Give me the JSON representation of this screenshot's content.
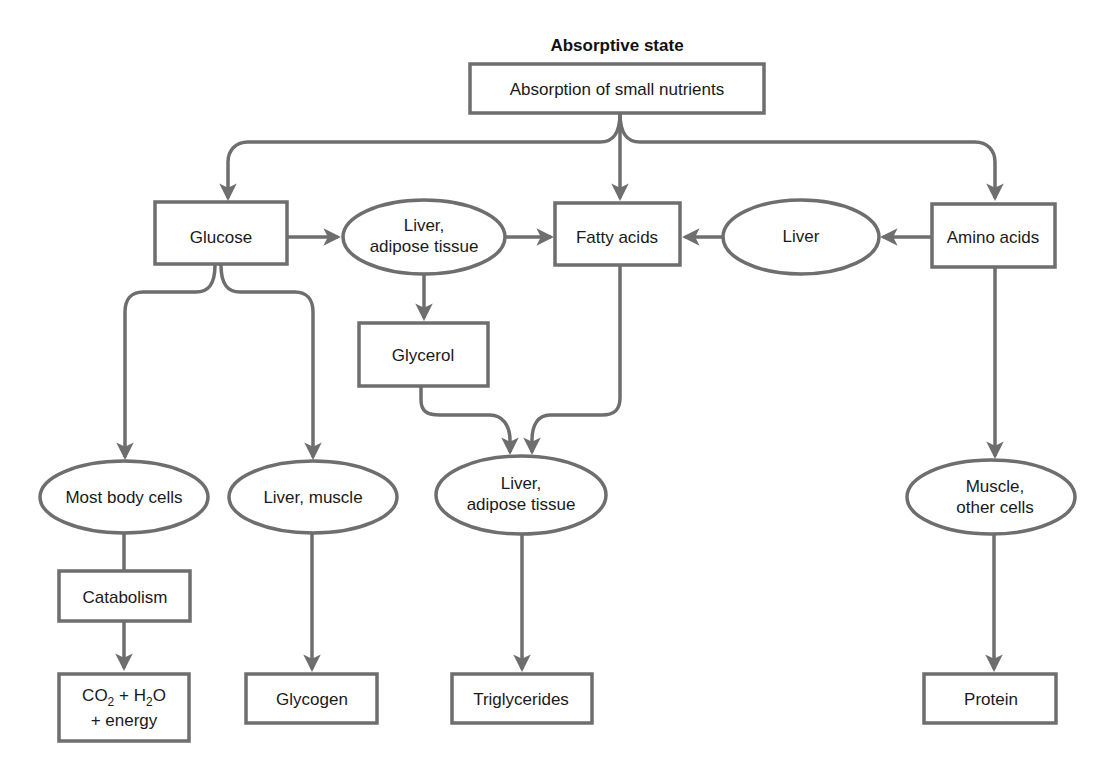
{
  "title": "Absorptive state",
  "colors": {
    "stroke": "#6e6e6e",
    "text": "#1a1a1a",
    "background": "#ffffff"
  },
  "nodes": {
    "absorption": {
      "shape": "box",
      "label": "Absorption of small nutrients"
    },
    "glucose": {
      "shape": "box",
      "label": "Glucose"
    },
    "liver_adipose_top": {
      "shape": "ellipse",
      "line1": "Liver,",
      "line2": "adipose tissue"
    },
    "fatty_acids": {
      "shape": "box",
      "label": "Fatty acids"
    },
    "liver": {
      "shape": "ellipse",
      "label": "Liver"
    },
    "amino_acids": {
      "shape": "box",
      "label": "Amino acids"
    },
    "glycerol": {
      "shape": "box",
      "label": "Glycerol"
    },
    "most_body_cells": {
      "shape": "ellipse",
      "label": "Most body cells"
    },
    "liver_muscle": {
      "shape": "ellipse",
      "label": "Liver, muscle"
    },
    "liver_adipose_bottom": {
      "shape": "ellipse",
      "line1": "Liver,",
      "line2": "adipose tissue"
    },
    "muscle_other": {
      "shape": "ellipse",
      "line1": "Muscle,",
      "line2": "other cells"
    },
    "catabolism": {
      "shape": "box",
      "label": "Catabolism"
    },
    "co2_h2o": {
      "shape": "box",
      "co2": "CO",
      "sub2a": "2",
      "plus_h": " + H",
      "sub2b": "2",
      "o": "O",
      "line2": "+ energy"
    },
    "glycogen": {
      "shape": "box",
      "label": "Glycogen"
    },
    "triglycerides": {
      "shape": "box",
      "label": "Triglycerides"
    },
    "protein": {
      "shape": "box",
      "label": "Protein"
    }
  },
  "edges": [
    {
      "from": "Absorption of small nutrients",
      "to": "Glucose"
    },
    {
      "from": "Absorption of small nutrients",
      "to": "Fatty acids"
    },
    {
      "from": "Absorption of small nutrients",
      "to": "Amino acids"
    },
    {
      "from": "Glucose",
      "to": "Liver, adipose tissue"
    },
    {
      "from": "Liver, adipose tissue",
      "to": "Fatty acids"
    },
    {
      "from": "Liver",
      "to": "Fatty acids"
    },
    {
      "from": "Amino acids",
      "to": "Liver"
    },
    {
      "from": "Liver, adipose tissue",
      "to": "Glycerol"
    },
    {
      "from": "Glucose",
      "to": "Most body cells"
    },
    {
      "from": "Glucose",
      "to": "Liver, muscle"
    },
    {
      "from": "Glycerol",
      "to": "Liver, adipose tissue (lower)"
    },
    {
      "from": "Fatty acids",
      "to": "Liver, adipose tissue (lower)"
    },
    {
      "from": "Amino acids",
      "to": "Muscle, other cells"
    },
    {
      "from": "Most body cells",
      "to": "Catabolism"
    },
    {
      "from": "Catabolism",
      "to": "CO2 + H2O + energy"
    },
    {
      "from": "Liver, muscle",
      "to": "Glycogen"
    },
    {
      "from": "Liver, adipose tissue (lower)",
      "to": "Triglycerides"
    },
    {
      "from": "Muscle, other cells",
      "to": "Protein"
    }
  ]
}
